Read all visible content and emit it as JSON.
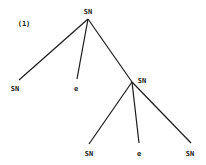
{
  "example_number": "(1)",
  "tree": {
    "root": {
      "label": "SN"
    },
    "level1": [
      {
        "label": "SN"
      },
      {
        "label": "e"
      },
      {
        "label": "SN"
      }
    ],
    "level2": [
      {
        "label": "SN"
      },
      {
        "label": "e"
      },
      {
        "label": "SN"
      }
    ]
  },
  "colors": {
    "line": "#1a1a1a",
    "background": "#ffffff"
  }
}
